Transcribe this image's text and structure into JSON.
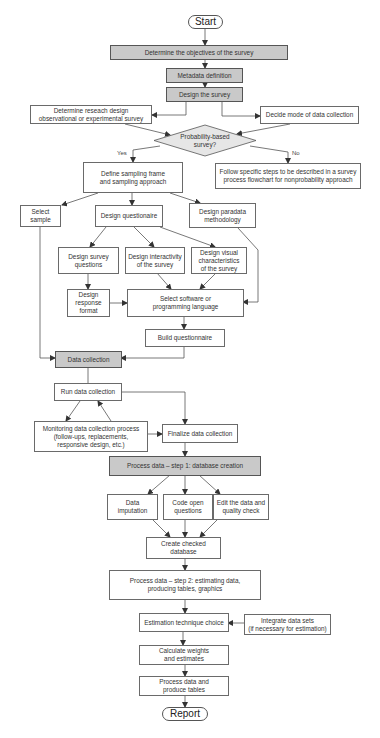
{
  "diagram": {
    "type": "flowchart",
    "title": "Survey process flowchart",
    "colors": {
      "highlight_fill": "#c9c9c9",
      "border": "#6a6a6a",
      "line": "#555555",
      "diamond_fill": "#e6e6e6"
    },
    "nodes": {
      "start": "Start",
      "objectives": "Determine the objectives of the survey",
      "metadata": "Metadata definition",
      "design_survey": "Design the survey",
      "research_design": "Determine reseach design\nobservational or experimental survey",
      "decide_mode": "Decide mode of data collection",
      "probability": "Probability-based\nsurvey?",
      "define_sampling": "Define sampling frame\nand sampling approach",
      "follow_steps": "Follow specific steps to be described in a survey\nprocess flowchart for nonprobability approach",
      "select_sample": "Select\nsample",
      "design_questionnaire": "Design questionaire",
      "design_paradata": "Design paradata\nmethodology",
      "design_survey_questions": "Design survey\nquestions",
      "design_interactivity": "Design interactivity\nof the survey",
      "design_visual": "Design visual\ncharacteristics\nof the survey",
      "design_response": "Design\nresponse\nformat",
      "select_software": "Select software or\nprogramming language",
      "build_questionnaire": "Build questionnaire",
      "data_collection": "Data collection",
      "run_collection": "Run data collection",
      "monitoring": "Monitoring data collection process\n(follow-ups, replacements,\nresponsive design, etc.)",
      "finalize": "Finalize data collection",
      "process_step1": "Process data – step 1: database creation",
      "data_imputation": "Data\nimputation",
      "code_open": "Code open\nquestions",
      "edit_data": "Edit the data and\nquality check",
      "create_checked": "Create checked\ndatabase",
      "process_step2": "Process data – step 2: estimating data,\nproducing tables, graphics",
      "estimation": "Estimation technique choice",
      "integrate": "Integrate data sets\n(if necessary for estimation)",
      "calculate": "Calculate weights\nand estimates",
      "process_produce": "Process data and\nproduce tables",
      "report": "Report"
    },
    "edge_labels": {
      "yes": "Yes",
      "no": "No"
    }
  }
}
